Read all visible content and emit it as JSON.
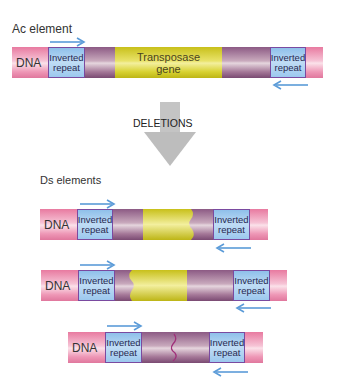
{
  "ac": {
    "title": "Ac element",
    "dna_label": "DNA",
    "left_repeat": "Inverted repeat",
    "right_repeat": "Inverted repeat",
    "gene_line1": "Transposase",
    "gene_line2": "gene"
  },
  "transition": {
    "label": "DELETIONS"
  },
  "ds": {
    "title": "Ds elements",
    "elements": [
      {
        "dna_label": "DNA",
        "left_repeat": "Inverted repeat",
        "right_repeat": "Inverted repeat",
        "variant": "partial-yellow-right-deleted"
      },
      {
        "dna_label": "DNA",
        "left_repeat": "Inverted repeat",
        "right_repeat": "Inverted repeat",
        "variant": "partial-yellow-left-deleted"
      },
      {
        "dna_label": "DNA",
        "left_repeat": "Inverted repeat",
        "right_repeat": "Inverted repeat",
        "variant": "gene-fully-deleted"
      }
    ]
  },
  "colors": {
    "dna": "#e87aa0",
    "inverted_repeat": "#9cc8ee",
    "transposase": "#d8d232",
    "spacer": "#a57898",
    "arrow": "#5b9bd8",
    "deletion_arrow": "#bdbdbd"
  }
}
